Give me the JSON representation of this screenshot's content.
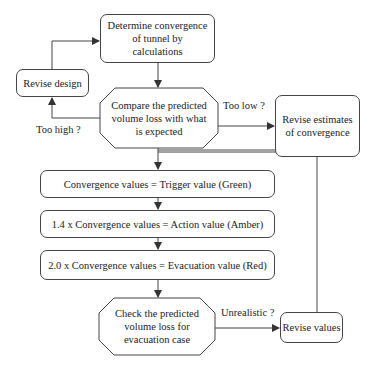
{
  "nodes": {
    "determine": "Determine convergence of tunnel by calculations",
    "revise_design": "Revise design",
    "compare": "Compare the predicted volume loss with what is expected",
    "revise_estimates": "Revise estimates of convergence",
    "trigger": "Convergence values = Trigger value (Green)",
    "action": "1.4 x Convergence values = Action value (Amber)",
    "evacuation": "2.0 x Convergence values = Evacuation value (Red)",
    "check": "Check the predicted volume loss for evacuation case",
    "revise_values": "Revise values"
  },
  "edge_labels": {
    "too_low": "Too low ?",
    "too_high": "Too high ?",
    "unrealistic": "Unrealistic ?"
  },
  "colors": {
    "stroke": "#444444",
    "text": "#222222",
    "background": "#ffffff"
  }
}
